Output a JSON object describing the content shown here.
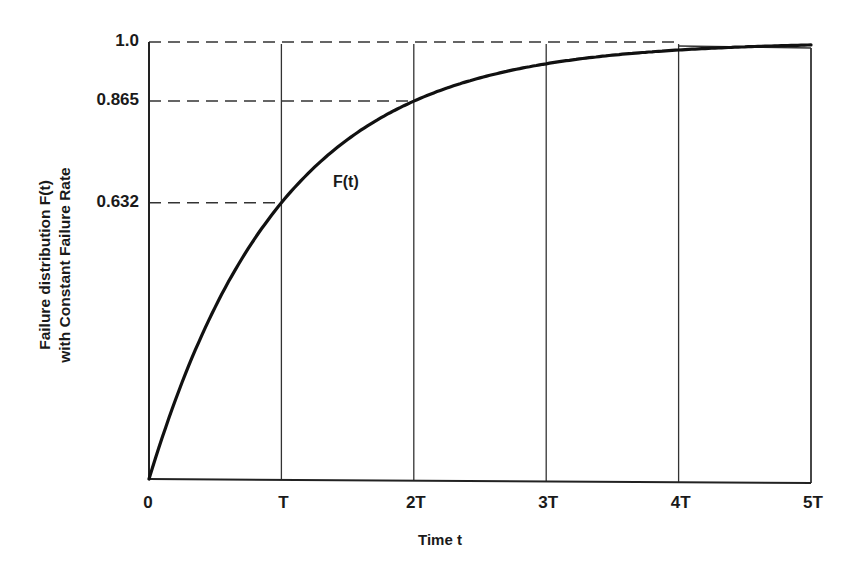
{
  "chart_data": {
    "type": "line",
    "title": "",
    "xlabel": "Time t",
    "ylabel_line1": "Failure distribution F(t)",
    "ylabel_line2": "with Constant Failure Rate",
    "ylabel": "Failure distribution F(t) with Constant Failure Rate",
    "x_tick_labels": [
      "0",
      "T",
      "2T",
      "3T",
      "4T",
      "5T"
    ],
    "x_tick_values": [
      0,
      1,
      2,
      3,
      4,
      5
    ],
    "y_tick_labels": [
      "1.0",
      "0.865",
      "0.632"
    ],
    "y_tick_values": [
      1.0,
      0.865,
      0.632
    ],
    "xlim": [
      0,
      5
    ],
    "ylim": [
      0,
      1.0
    ],
    "grid": "vertical lines at each multiple of T; dashed horizontal reference lines at 0.632, 0.865, 1.0",
    "series": [
      {
        "name": "F(t)",
        "formula": "F(t) = 1 - exp(-t/T)",
        "x": [
          0,
          0.5,
          1,
          1.5,
          2,
          2.5,
          3,
          3.5,
          4,
          4.5,
          5
        ],
        "y": [
          0,
          0.393,
          0.632,
          0.777,
          0.865,
          0.918,
          0.95,
          0.97,
          0.982,
          0.989,
          0.993
        ]
      }
    ],
    "annotations": [
      {
        "text": "F(t)",
        "x": 1.6,
        "y": 0.63
      }
    ]
  }
}
